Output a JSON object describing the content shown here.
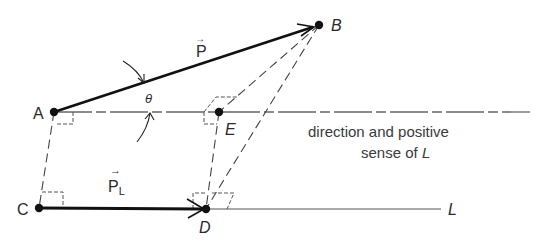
{
  "figure": {
    "points": {
      "A": {
        "label": "A",
        "x": 54,
        "y": 112
      },
      "B": {
        "label": "B",
        "x": 319,
        "y": 25
      },
      "C": {
        "label": "C",
        "x": 39,
        "y": 208
      },
      "D": {
        "label": "D",
        "x": 206,
        "y": 209
      },
      "E": {
        "label": "E",
        "x": 219,
        "y": 112
      }
    },
    "vectors": {
      "P": {
        "label": "P",
        "arrow": "→"
      },
      "PL": {
        "label": "P",
        "subscript": "L",
        "arrow": "→"
      }
    },
    "angle_label": "θ",
    "line_label": "L",
    "annotation": {
      "line1": "direction and positive",
      "line2_prefix": "sense of ",
      "line2_italic": "L"
    },
    "colors": {
      "ink": "#1a1a1a",
      "guide": "#555555",
      "background": "#ffffff"
    }
  }
}
